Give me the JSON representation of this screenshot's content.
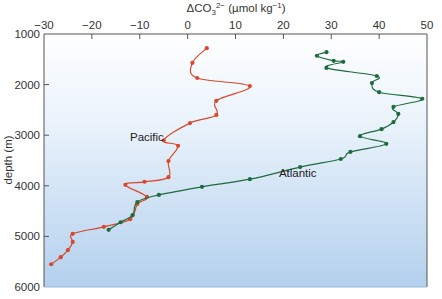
{
  "chart_data": {
    "type": "line",
    "title": "",
    "xlabel": "ΔCO₃²⁻ (µmol kg⁻¹)",
    "ylabel": "depth (m)",
    "xlim": [
      -30,
      50
    ],
    "ylim": [
      6000,
      1000
    ],
    "x_axis_position": "top",
    "y_inverted": true,
    "x_ticks": [
      -30,
      -20,
      -10,
      0,
      10,
      20,
      30,
      40,
      50
    ],
    "y_ticks": [
      1000,
      2000,
      3000,
      4000,
      5000,
      6000
    ],
    "grid": false,
    "legend": "inline labels",
    "background": "gradient white to light blue",
    "series": [
      {
        "name": "Pacific",
        "color": "#d9482b",
        "points": [
          [
            4,
            1280
          ],
          [
            1,
            1570
          ],
          [
            2,
            1870
          ],
          [
            13,
            2030
          ],
          [
            6,
            2320
          ],
          [
            6,
            2600
          ],
          [
            0.5,
            2760
          ],
          [
            -5,
            3100
          ],
          [
            -2,
            3210
          ],
          [
            -4,
            3510
          ],
          [
            -4,
            3830
          ],
          [
            -9,
            3920
          ],
          [
            -13,
            3980
          ],
          [
            -8.5,
            4220
          ],
          [
            -10.5,
            4360
          ],
          [
            -12,
            4660
          ],
          [
            -17.5,
            4810
          ],
          [
            -24,
            4950
          ],
          [
            -24,
            5110
          ],
          [
            -25,
            5270
          ],
          [
            -26.5,
            5410
          ],
          [
            -28.5,
            5550
          ]
        ],
        "label_pos": [
          -8.5,
          3110
        ]
      },
      {
        "name": "Atlantic",
        "color": "#1f6b3e",
        "points": [
          [
            29,
            1360
          ],
          [
            27,
            1430
          ],
          [
            30.5,
            1530
          ],
          [
            32.5,
            1550
          ],
          [
            29,
            1670
          ],
          [
            39.5,
            1830
          ],
          [
            38.5,
            1970
          ],
          [
            40,
            2150
          ],
          [
            49,
            2280
          ],
          [
            43,
            2440
          ],
          [
            44,
            2580
          ],
          [
            43,
            2740
          ],
          [
            40.5,
            2880
          ],
          [
            36,
            3020
          ],
          [
            41.5,
            3170
          ],
          [
            34,
            3330
          ],
          [
            32,
            3470
          ],
          [
            23.5,
            3630
          ],
          [
            13,
            3870
          ],
          [
            3,
            4020
          ],
          [
            -6,
            4180
          ],
          [
            -10.5,
            4320
          ],
          [
            -11.5,
            4580
          ],
          [
            -14,
            4720
          ],
          [
            -16.5,
            4870
          ]
        ],
        "label_pos": [
          23,
          3830
        ]
      }
    ]
  }
}
